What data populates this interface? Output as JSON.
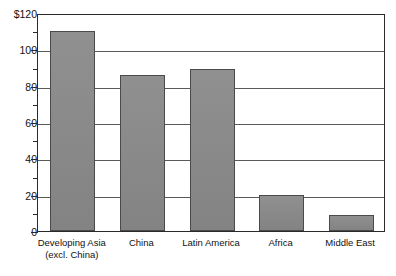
{
  "chart_data": {
    "type": "bar",
    "title": "",
    "xlabel": "",
    "ylabel": "",
    "categories": [
      "Developing Asia (excl. China)",
      "China",
      "Latin America",
      "Africa",
      "Middle East"
    ],
    "category_lines": [
      [
        "Developing Asia",
        "(excl. China)"
      ],
      [
        "China"
      ],
      [
        "Latin America"
      ],
      [
        "Africa"
      ],
      [
        "Middle East"
      ]
    ],
    "values": [
      110,
      86,
      89,
      20,
      9
    ],
    "ylim": [
      0,
      120
    ],
    "ytick_labels": [
      "0",
      "20",
      "40",
      "60",
      "80",
      "100",
      "$120"
    ],
    "ytick_values": [
      0,
      20,
      40,
      60,
      80,
      100,
      120
    ],
    "yminor_ticks": [
      10,
      30,
      50,
      70,
      90,
      110
    ],
    "grid": "horizontal",
    "legend": "none",
    "bar_color": "#8a8a8a",
    "axis_color": "#2a2a2a",
    "grid_color": "#5a5a5a"
  }
}
